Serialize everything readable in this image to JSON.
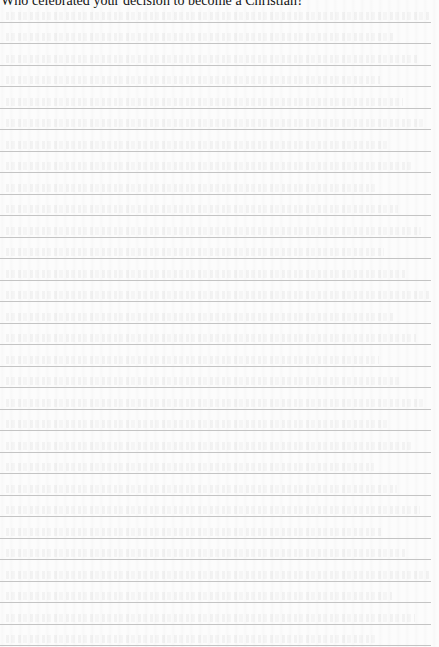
{
  "page": {
    "header_prompt": "Who celebrated your decision to become a Christian?",
    "ruled_lines": {
      "count": 30,
      "first_y": 21.5,
      "spacing": 21.5,
      "color": "#c4c4c4"
    },
    "background_color": "#fcfcfc",
    "text_color": "#111111"
  }
}
